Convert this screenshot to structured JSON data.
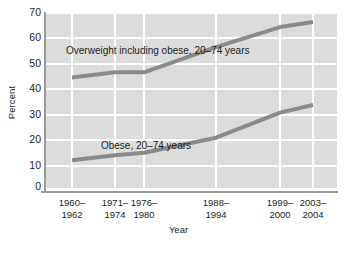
{
  "chart_data": {
    "type": "line",
    "title": "",
    "xlabel": "Year",
    "ylabel": "Percent",
    "categories": [
      "1960–1962",
      "1971–1974",
      "1976–1980",
      "1988–1994",
      "1999–2000",
      "2003–2004"
    ],
    "category_lines": [
      [
        "1960–",
        "1962"
      ],
      [
        "1971–",
        "1974"
      ],
      [
        "1976–",
        "1980"
      ],
      [
        "1988–",
        "1994"
      ],
      [
        "1999–",
        "2000"
      ],
      [
        "2003–",
        "2004"
      ]
    ],
    "ylim": [
      0,
      70
    ],
    "yticks": [
      0,
      10,
      20,
      30,
      40,
      50,
      60,
      70
    ],
    "grid": true,
    "legend_position": "inline-annotations",
    "series": [
      {
        "name": "Overweight including obese, 20–74 years",
        "label_lines": [
          "Overweight including obese,",
          "20–74 years"
        ],
        "values": [
          44,
          46,
          46,
          56,
          64,
          66
        ],
        "color": "#8a8a8a"
      },
      {
        "name": "Obese, 20–74 years",
        "label_lines": [
          "Obese, 20–74 years"
        ],
        "values": [
          11,
          13,
          14,
          20,
          30,
          33
        ],
        "color": "#8a8a8a"
      }
    ],
    "colors": {
      "plot_background": "#dcdcdc",
      "gridline": "#ffffff",
      "axis": "#9a9a9a",
      "text": "#231f20",
      "line": "#8a8a8a"
    }
  }
}
